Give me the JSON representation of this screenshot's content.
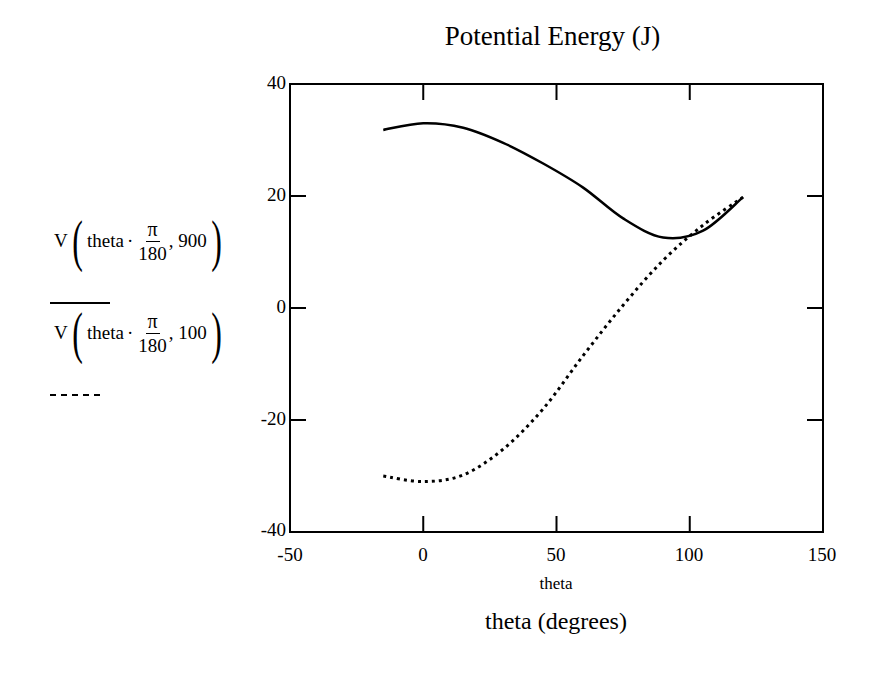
{
  "chart_data": {
    "type": "line",
    "title": "Potential Energy (J)",
    "xlabel": "theta (degrees)",
    "x_variable_label": "theta",
    "ylabel": "",
    "xlim": [
      -50,
      150
    ],
    "ylim": [
      -40,
      40
    ],
    "x_ticks": [
      "-50",
      "0",
      "50",
      "100",
      "150"
    ],
    "y_ticks": [
      "40",
      "20",
      "0",
      "-20",
      "-40"
    ],
    "grid": false,
    "legend_position": "left",
    "x": [
      -15,
      0,
      15,
      30,
      45,
      60,
      75,
      90,
      105,
      120
    ],
    "series": [
      {
        "name": "V(theta·π/180, 900)",
        "style": "solid",
        "values": [
          31.8,
          33.0,
          32.2,
          29.5,
          25.8,
          21.5,
          16.0,
          12.6,
          13.8,
          19.8
        ]
      },
      {
        "name": "V(theta·π/180, 100)",
        "style": "dotted",
        "values": [
          -30.0,
          -31.0,
          -29.8,
          -25.2,
          -18.0,
          -8.5,
          0.5,
          8.5,
          14.8,
          19.8
        ]
      }
    ]
  },
  "legend": {
    "series1": {
      "func": "V",
      "var": "theta",
      "dot": "·",
      "num": "π",
      "den": "180",
      "arg": ", 900"
    },
    "series2": {
      "func": "V",
      "var": "theta",
      "dot": "·",
      "num": "π",
      "den": "180",
      "arg": ", 100"
    }
  },
  "colors": {
    "line": "#000000",
    "background": "#ffffff"
  }
}
